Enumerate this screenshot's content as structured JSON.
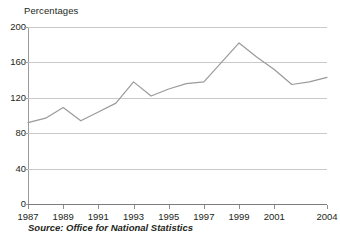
{
  "chart_data": {
    "type": "line",
    "title": "",
    "subtitle": "",
    "ylabel": "Percentages",
    "xlabel": "",
    "ylim": [
      0,
      200
    ],
    "yticks": [
      0,
      40,
      80,
      120,
      160,
      200
    ],
    "ytick_labels": [
      "0",
      "40",
      "80",
      "120",
      "160",
      "200"
    ],
    "xlim": [
      1987,
      2004
    ],
    "xticks": [
      1987,
      1989,
      1991,
      1993,
      1995,
      1997,
      1999,
      2001,
      2004
    ],
    "xtick_labels": [
      "1987",
      "1989",
      "1991",
      "1993",
      "1995",
      "1997",
      "1999",
      "2001",
      "2004"
    ],
    "grid": "horizontal",
    "legend": "none",
    "x": [
      1987,
      1988,
      1989,
      1990,
      1991,
      1992,
      1993,
      1994,
      1995,
      1996,
      1997,
      1998,
      1999,
      2000,
      2001,
      2002,
      2003,
      2004
    ],
    "values": [
      92,
      97,
      109,
      94,
      104,
      114,
      138,
      122,
      130,
      136,
      138,
      160,
      182,
      166,
      152,
      135,
      138,
      143
    ],
    "series": [
      {
        "name": "Percentages",
        "values": [
          92,
          97,
          109,
          94,
          104,
          114,
          138,
          122,
          130,
          136,
          138,
          160,
          182,
          166,
          152,
          135,
          138,
          143
        ]
      }
    ],
    "line_color": "#9a9a9a",
    "grid_color": "#c9c9c9",
    "axis_color": "#8d8d8d",
    "text_color": "#231f20",
    "annotations": []
  },
  "footer": {
    "source": "Source: Office for National Statistics"
  }
}
